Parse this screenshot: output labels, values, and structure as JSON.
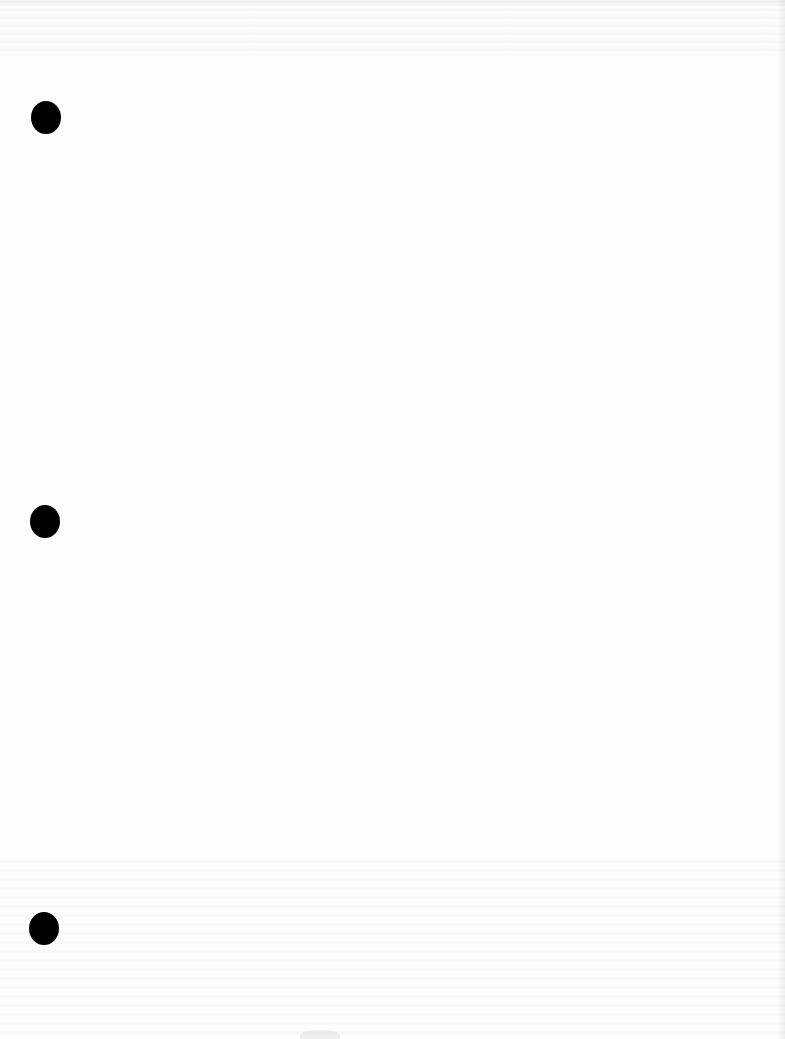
{
  "document": {
    "type": "blank loose-leaf page (scanned)",
    "background_color": "#fdfdfd",
    "text_content": "",
    "punch_holes": [
      {
        "index": 1,
        "color": "#000000"
      },
      {
        "index": 2,
        "color": "#000000"
      },
      {
        "index": 3,
        "color": "#000000"
      }
    ]
  }
}
